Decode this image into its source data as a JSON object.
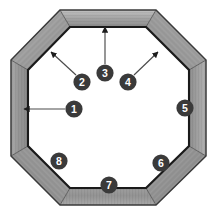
{
  "figure": {
    "name": "octagonal-frame-diagram",
    "background_color": "#ffffff",
    "shape": "octagon",
    "frame_member_count": 8
  },
  "colors": {
    "frame_fill_light": "#b5b5b5",
    "frame_fill_mid": "#9a9a9a",
    "frame_fill_dark": "#7e7e7e",
    "frame_fill_darker": "#6d6d6d",
    "outline": "#2b2b2b",
    "inner_outline": "#1a1a1a",
    "callout_circle": "#3a3a3a",
    "callout_text": "#ffffff",
    "leader_line": "#4a4a4a",
    "inner_opening": "#ffffff"
  },
  "geometry": {
    "outer_octagon_points": "60,10 156,10 206,60 206,156 156,205 60,205 11,156 11,60",
    "inner_octagon_points": "70,27 146,27 189,70 189,146 146,188 70,188 28,146 28,70",
    "miter_lines": [
      {
        "name": "miter-top-left",
        "x1": 60,
        "y1": 10,
        "x2": 70,
        "y2": 27
      },
      {
        "name": "miter-top-right",
        "x1": 156,
        "y1": 10,
        "x2": 146,
        "y2": 27
      },
      {
        "name": "miter-right-top",
        "x1": 206,
        "y1": 60,
        "x2": 189,
        "y2": 70
      },
      {
        "name": "miter-right-bottom",
        "x1": 206,
        "y1": 156,
        "x2": 189,
        "y2": 146
      },
      {
        "name": "miter-bottom-right",
        "x1": 156,
        "y1": 205,
        "x2": 146,
        "y2": 188
      },
      {
        "name": "miter-bottom-left",
        "x1": 60,
        "y1": 205,
        "x2": 70,
        "y2": 188
      },
      {
        "name": "miter-left-bottom",
        "x1": 11,
        "y1": 156,
        "x2": 28,
        "y2": 146
      },
      {
        "name": "miter-left-top",
        "x1": 11,
        "y1": 60,
        "x2": 28,
        "y2": 70
      }
    ]
  },
  "callouts": [
    {
      "id": "1",
      "label": "1",
      "circle": {
        "cx": 74,
        "cy": 109,
        "r": 8.6
      },
      "leader": {
        "type": "line",
        "x1": 65,
        "y1": 109,
        "x2": 22,
        "y2": 109
      },
      "arrow": {
        "x": 22,
        "y": 109,
        "direction": "left"
      },
      "points_to": "left-vertical-member"
    },
    {
      "id": "2",
      "label": "2",
      "circle": {
        "cx": 82,
        "cy": 82,
        "r": 8.6
      },
      "leader": {
        "type": "line",
        "x1": 76,
        "y1": 75,
        "x2": 49,
        "y2": 50
      },
      "arrow": {
        "x": 49,
        "y": 50,
        "direction": "upleft"
      },
      "points_to": "upper-left-diagonal-member"
    },
    {
      "id": "3",
      "label": "3",
      "circle": {
        "cx": 105,
        "cy": 73,
        "r": 8.6
      },
      "leader": {
        "type": "line",
        "x1": 105,
        "y1": 64,
        "x2": 105,
        "y2": 25
      },
      "arrow": {
        "x": 105,
        "y": 25,
        "direction": "up"
      },
      "points_to": "top-horizontal-member"
    },
    {
      "id": "4",
      "label": "4",
      "circle": {
        "cx": 128,
        "cy": 82,
        "r": 8.6
      },
      "leader": {
        "type": "line",
        "x1": 134,
        "y1": 75,
        "x2": 160,
        "y2": 50
      },
      "arrow": {
        "x": 160,
        "y": 50,
        "direction": "upright"
      },
      "points_to": "upper-right-diagonal-member"
    },
    {
      "id": "5",
      "label": "5",
      "circle": {
        "cx": 185,
        "cy": 108,
        "r": 8.6
      },
      "leader": null,
      "arrow": null,
      "points_to": "right-vertical-member"
    },
    {
      "id": "6",
      "label": "6",
      "circle": {
        "cx": 161,
        "cy": 163,
        "r": 8.6
      },
      "leader": null,
      "arrow": null,
      "points_to": "lower-right-diagonal-member"
    },
    {
      "id": "7",
      "label": "7",
      "circle": {
        "cx": 109,
        "cy": 185,
        "r": 8.6
      },
      "leader": null,
      "arrow": null,
      "points_to": "bottom-horizontal-member"
    },
    {
      "id": "8",
      "label": "8",
      "circle": {
        "cx": 59,
        "cy": 161,
        "r": 8.6
      },
      "leader": null,
      "arrow": null,
      "points_to": "lower-left-diagonal-member"
    }
  ]
}
